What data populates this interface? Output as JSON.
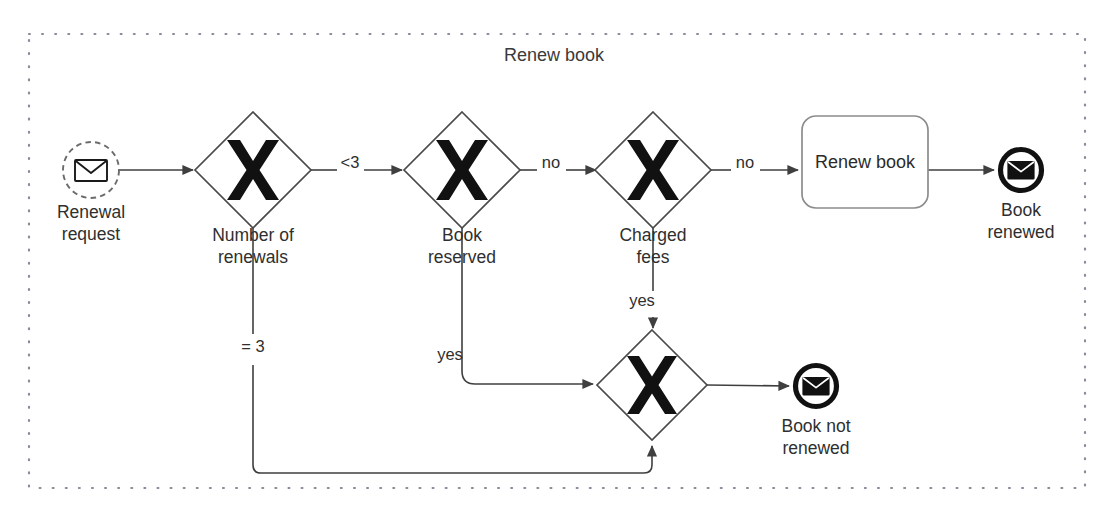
{
  "pool": {
    "name": "pool-renew-book",
    "title": "Renew book",
    "border_color": "#8a8a9a",
    "x": 29,
    "y": 34,
    "width": 1056,
    "height": 454
  },
  "nodes": [
    {
      "id": "start-renewal-request",
      "type": "start-event-message",
      "label": "Renewal\nrequest",
      "icon": "envelope-icon",
      "cx": 91,
      "cy": 170,
      "r": 28,
      "label_x": 91,
      "label_y": 201
    },
    {
      "id": "gateway-number-of-renewals",
      "type": "exclusive-gateway",
      "label": "Number of\nrenewals",
      "icon": "exclusive-x-icon",
      "cx": 253,
      "cy": 170,
      "half": 58,
      "label_x": 253,
      "label_y": 224
    },
    {
      "id": "gateway-book-reserved",
      "type": "exclusive-gateway",
      "label": "Book\nreserved",
      "icon": "exclusive-x-icon",
      "cx": 462,
      "cy": 170,
      "half": 58,
      "label_x": 462,
      "label_y": 224
    },
    {
      "id": "gateway-charged-fees",
      "type": "exclusive-gateway",
      "label": "Charged\nfees",
      "icon": "exclusive-x-icon",
      "cx": 653,
      "cy": 170,
      "half": 58,
      "label_x": 653,
      "label_y": 224
    },
    {
      "id": "task-renew-book",
      "type": "task",
      "label": "Renew book",
      "x": 802,
      "y": 116,
      "width": 126,
      "height": 92,
      "rx": 14
    },
    {
      "id": "end-book-renewed",
      "type": "end-event-message",
      "label": "Book\nrenewed",
      "icon": "envelope-icon",
      "cx": 1021,
      "cy": 170,
      "r": 23,
      "label_x": 1021,
      "label_y": 199
    },
    {
      "id": "gateway-merge-not-renewed",
      "type": "exclusive-gateway",
      "label": "",
      "icon": "exclusive-x-icon",
      "cx": 652,
      "cy": 385,
      "half": 55,
      "label_x": 652,
      "label_y": 442
    },
    {
      "id": "end-book-not-renewed",
      "type": "end-event-message",
      "label": "Book not\nrenewed",
      "icon": "envelope-icon",
      "cx": 816,
      "cy": 386,
      "r": 23,
      "label_x": 816,
      "label_y": 415
    }
  ],
  "edges": [
    {
      "id": "flow-start-to-renewals",
      "from": "start-renewal-request",
      "to": "gateway-number-of-renewals",
      "label": "",
      "path": "M 119 170 L 193 170"
    },
    {
      "id": "flow-renewals-lt3-to-reserved",
      "from": "gateway-number-of-renewals",
      "to": "gateway-book-reserved",
      "label": "<3",
      "label_x": 350,
      "label_y": 160,
      "path": "M 311 170 L 335 170 M 366 170 L 402 170"
    },
    {
      "id": "flow-renewals-eq3-to-merge",
      "from": "gateway-number-of-renewals",
      "to": "gateway-merge-not-renewed",
      "label": "= 3",
      "label_x": 253,
      "label_y": 348,
      "path": "M 253 228 L 253 335 M 253 366 L 253 466 Q 253 473 260 473 L 645 473 Q 652 473 652 466 L 652 443"
    },
    {
      "id": "flow-reserved-no-to-fees",
      "from": "gateway-book-reserved",
      "to": "gateway-charged-fees",
      "label": "no",
      "label_x": 551,
      "label_y": 160,
      "path": "M 520 170 L 536 170 M 568 170 L 593 170"
    },
    {
      "id": "flow-reserved-yes-to-merge",
      "from": "gateway-book-reserved",
      "to": "gateway-merge-not-renewed",
      "label": "yes",
      "label_x": 450,
      "label_y": 355,
      "path": "M 462 228 L 462 372 Q 462 385 475 385 L 590 385"
    },
    {
      "id": "flow-fees-no-to-task",
      "from": "gateway-charged-fees",
      "to": "task-renew-book",
      "label": "no",
      "label_x": 745,
      "label_y": 160,
      "path": "M 711 170 L 730 170 M 762 170 L 797 170"
    },
    {
      "id": "flow-fees-yes-to-merge",
      "from": "gateway-charged-fees",
      "to": "gateway-merge-not-renewed",
      "label": "yes",
      "label_x": 641,
      "label_y": 300,
      "path": "M 653 228 L 653 292 M 653 318 L 653 325"
    },
    {
      "id": "flow-task-to-book-renewed",
      "from": "task-renew-book",
      "to": "end-book-renewed",
      "label": "",
      "path": "M 928 170 L 993 170"
    },
    {
      "id": "flow-merge-to-book-not-renewed",
      "from": "gateway-merge-not-renewed",
      "to": "end-book-not-renewed",
      "label": "",
      "path": "M 707 385 L 788 386"
    }
  ],
  "colors": {
    "line": "#3f3f3f",
    "text": "#2f2f2f",
    "pool_border": "#8a8a9a",
    "gateway_symbol": "#111111",
    "background": "#ffffff"
  }
}
